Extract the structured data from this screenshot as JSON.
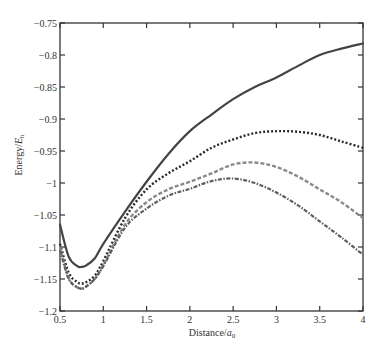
{
  "chart_data": {
    "type": "line",
    "title": "",
    "xlabel": "Distance/a0",
    "xlabel_main": "Distance/",
    "xlabel_italic": "a",
    "xlabel_sub": "0",
    "ylabel": "Energy/E_h",
    "ylabel_main": "Energy/",
    "ylabel_italic": "E",
    "ylabel_sub": "h",
    "xlim": [
      0.5,
      4
    ],
    "ylim": [
      -1.2,
      -0.75
    ],
    "x_ticks": [
      0.5,
      1,
      1.5,
      2,
      2.5,
      3,
      3.5,
      4
    ],
    "x_tick_labels": [
      "0.5",
      "1",
      "1.5",
      "2",
      "2.5",
      "3",
      "3.5",
      "4"
    ],
    "y_ticks": [
      -0.75,
      -0.8,
      -0.85,
      -0.9,
      -0.95,
      -1,
      -1.05,
      -1.1,
      -1.15,
      -1.2
    ],
    "y_tick_labels": [
      "-0.75",
      "-0.8",
      "-0.85",
      "-0.9",
      "-0.95",
      "-1",
      "-1.05",
      "-1.1",
      "-1.15",
      "-1.2"
    ],
    "grid": false,
    "legend": null,
    "x": [
      0.5,
      0.6,
      0.7,
      0.75,
      0.8,
      0.9,
      1.0,
      1.25,
      1.5,
      1.75,
      2.0,
      2.25,
      2.5,
      2.75,
      3.0,
      3.25,
      3.5,
      3.75,
      4.0
    ],
    "series": [
      {
        "name": "solid",
        "style": "solid",
        "color": "#444444",
        "values": [
          -1.065,
          -1.115,
          -1.13,
          -1.131,
          -1.129,
          -1.118,
          -1.095,
          -1.045,
          -0.998,
          -0.955,
          -0.919,
          -0.893,
          -0.869,
          -0.85,
          -0.835,
          -0.817,
          -0.8,
          -0.79,
          -0.782
        ]
      },
      {
        "name": "dotted",
        "style": "dotted",
        "color": "#2a2a2a",
        "values": [
          -1.095,
          -1.14,
          -1.155,
          -1.157,
          -1.155,
          -1.145,
          -1.122,
          -1.055,
          -1.01,
          -0.985,
          -0.966,
          -0.945,
          -0.932,
          -0.922,
          -0.919,
          -0.92,
          -0.925,
          -0.935,
          -0.945
        ]
      },
      {
        "name": "dashed",
        "style": "dashed",
        "color": "#8a8a8a",
        "values": [
          -1.1,
          -1.148,
          -1.163,
          -1.165,
          -1.162,
          -1.15,
          -1.128,
          -1.065,
          -1.03,
          -1.01,
          -0.998,
          -0.985,
          -0.971,
          -0.968,
          -0.975,
          -0.99,
          -1.01,
          -1.03,
          -1.055
        ]
      },
      {
        "name": "dash-dot",
        "style": "dashdot",
        "color": "#5e5e5e",
        "values": [
          -1.105,
          -1.15,
          -1.163,
          -1.165,
          -1.162,
          -1.15,
          -1.13,
          -1.07,
          -1.04,
          -1.02,
          -1.009,
          -0.997,
          -0.993,
          -1.0,
          -1.015,
          -1.035,
          -1.06,
          -1.085,
          -1.112
        ]
      }
    ]
  }
}
